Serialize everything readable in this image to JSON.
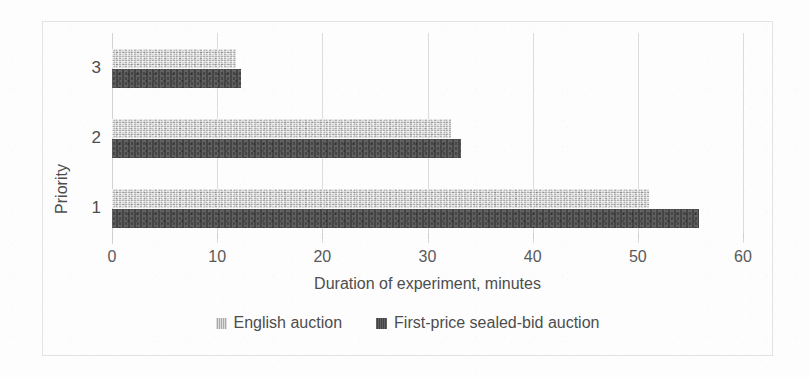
{
  "chart_data": {
    "type": "bar",
    "orientation": "horizontal",
    "title": "",
    "xlabel": "Duration of experiment, minutes",
    "ylabel": "Priority",
    "categories": [
      "1",
      "2",
      "3"
    ],
    "xlim": [
      0,
      60
    ],
    "xticks": [
      "0",
      "10",
      "20",
      "30",
      "40",
      "50",
      "60"
    ],
    "xtick_values": [
      0,
      10,
      20,
      30,
      40,
      50,
      60
    ],
    "yticks": [
      "1",
      "2",
      "3"
    ],
    "grid": true,
    "legend_position": "bottom",
    "series": [
      {
        "name": "English auction",
        "color": "#b9b9b9",
        "values": [
          51.1,
          32.2,
          11.8
        ]
      },
      {
        "name": "First-price sealed-bid auction",
        "color": "#4d4d4d",
        "values": [
          55.8,
          33.2,
          12.3
        ]
      }
    ]
  },
  "legend": {
    "items": [
      {
        "label": "English auction",
        "swatch": "light-gray-square-icon"
      },
      {
        "label": "First-price sealed-bid auction",
        "swatch": "dark-gray-square-icon"
      }
    ]
  }
}
